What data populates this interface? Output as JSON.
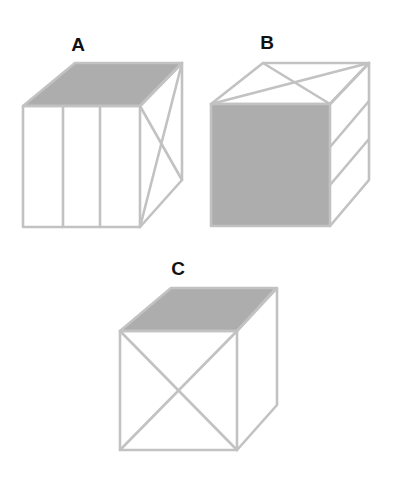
{
  "figure": {
    "colors": {
      "line": "#c2c2c2",
      "shade": "#adadad",
      "label": "#111111",
      "background": "#ffffff"
    },
    "cubes": [
      {
        "label": "A",
        "shaded_face": "top",
        "front_face": "three vertical stripes",
        "right_face": "X diagonals"
      },
      {
        "label": "B",
        "shaded_face": "front",
        "top_face": "X diagonals",
        "right_face": "three horizontal bands"
      },
      {
        "label": "C",
        "shaded_face": "top",
        "front_face": "X diagonals",
        "right_face": "blank"
      }
    ]
  }
}
